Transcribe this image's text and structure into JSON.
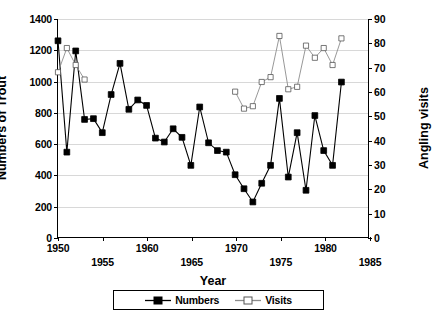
{
  "chart_data": {
    "type": "line",
    "title": "",
    "xlabel": "Year",
    "ylabel": "Numbers of Trout",
    "ylabel_right": "Angling visits",
    "xlim": [
      1950,
      1985
    ],
    "ylim": [
      0,
      1400
    ],
    "ylim_right": [
      0,
      90
    ],
    "xticks": [
      1950,
      1955,
      1960,
      1965,
      1970,
      1975,
      1980,
      1985
    ],
    "yticks": [
      0,
      200,
      400,
      600,
      800,
      1000,
      1200,
      1400
    ],
    "yticks_right": [
      0,
      10,
      20,
      30,
      40,
      50,
      60,
      70,
      80,
      90
    ],
    "grid": true,
    "legend_position": "bottom-center",
    "legend": [
      "Numbers",
      "Visits"
    ],
    "series": [
      {
        "name": "Numbers",
        "axis": "left",
        "marker": "filled-square",
        "color": "#000000",
        "x": [
          1950,
          1951,
          1952,
          1953,
          1954,
          1955,
          1956,
          1957,
          1958,
          1959,
          1960,
          1961,
          1962,
          1963,
          1964,
          1965,
          1966,
          1967,
          1968,
          1969,
          1970,
          1971,
          1972,
          1973,
          1974,
          1975,
          1976,
          1977,
          1978,
          1979,
          1980,
          1981,
          1982
        ],
        "values": [
          1260,
          545,
          1195,
          755,
          760,
          670,
          915,
          1115,
          820,
          880,
          845,
          635,
          610,
          695,
          640,
          460,
          835,
          605,
          555,
          545,
          400,
          310,
          225,
          345,
          460,
          890,
          385,
          670,
          300,
          780,
          555,
          460,
          995
        ]
      },
      {
        "name": "Visits",
        "axis": "right",
        "marker": "open-square",
        "color": "#8c8c8c",
        "x": [
          1950,
          1951,
          1952,
          1953,
          1970,
          1971,
          1972,
          1973,
          1974,
          1975,
          1976,
          1977,
          1978,
          1979,
          1980,
          1981,
          1982
        ],
        "values": [
          68,
          78,
          71,
          65,
          60,
          53,
          54,
          64,
          66,
          83,
          61,
          62,
          79,
          74,
          78,
          71,
          82
        ]
      }
    ]
  },
  "axes": {
    "y_left": {
      "title": "Numbers of Trout",
      "ticks": [
        "0",
        "200",
        "400",
        "600",
        "800",
        "1000",
        "1200",
        "1400"
      ]
    },
    "y_right": {
      "title": "Angling visits",
      "ticks": [
        "0",
        "10",
        "20",
        "30",
        "40",
        "50",
        "60",
        "70",
        "80",
        "90"
      ]
    },
    "x": {
      "title": "Year",
      "ticks": [
        "1950",
        "1955",
        "1960",
        "1965",
        "1970",
        "1975",
        "1980",
        "1985"
      ]
    }
  },
  "legend": {
    "entries": [
      {
        "label": "Numbers",
        "marker": "filled-square-icon"
      },
      {
        "label": "Visits",
        "marker": "open-square-icon"
      }
    ]
  },
  "colors": {
    "numbers_series": "#000000",
    "visits_series": "#8c8c8c",
    "gridline": "#d8d8d8",
    "axis": "#000000",
    "background": "#ffffff"
  }
}
